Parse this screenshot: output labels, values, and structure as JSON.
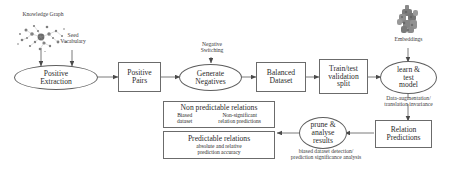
{
  "diagram": {
    "nodes": {
      "positive_extraction": "Positive\nExtraction",
      "positive_extraction_l1": "Positive",
      "positive_extraction_l2": "Extraction",
      "positive_pairs_l1": "Positive",
      "positive_pairs_l2": "Pairs",
      "generate_negatives_l1": "Generate",
      "generate_negatives_l2": "Negatives",
      "balanced_dataset_l1": "Balanced",
      "balanced_dataset_l2": "Dataset",
      "train_test_l1": "Train/test",
      "train_test_l2": "validation",
      "train_test_l3": "split",
      "learn_test_l1": "learn &",
      "learn_test_l2": "test",
      "learn_test_l3": "model",
      "relation_predictions_l1": "Relation",
      "relation_predictions_l2": "Predictions",
      "prune_analyse_l1": "prune &",
      "prune_analyse_l2": "analyse",
      "prune_analyse_l3": "results",
      "non_predictable_title": "Non predictable relations",
      "non_predictable_sub_left_l1": "Biased",
      "non_predictable_sub_left_l2": "dataset",
      "non_predictable_sub_right_l1": "Non-significant",
      "non_predictable_sub_right_l2": "relation predictions",
      "predictable_title": "Predictable relations",
      "predictable_sub_l1": "absolute and relative",
      "predictable_sub_l2": "prediction accuracy"
    },
    "captions": {
      "knowledge_graph": "Knowledge Graph",
      "seed_vocabulary_l1": "Seed",
      "seed_vocabulary_l2": "Vocabulary",
      "negative_switching_l1": "Negative",
      "negative_switching_l2": "Switching",
      "embeddings": "Embeddings",
      "data_augmentation_l1": "Data-augmentation/",
      "data_augmentation_l2": "translation invariance",
      "biased_detection_l1": "biased dataset detection/",
      "biased_detection_l2": "prediction significance analysis"
    },
    "colors": {
      "stroke": "#6b6b6b",
      "text": "#2b2b2b",
      "background": "#ffffff",
      "blob": "#7a7a7a"
    }
  }
}
